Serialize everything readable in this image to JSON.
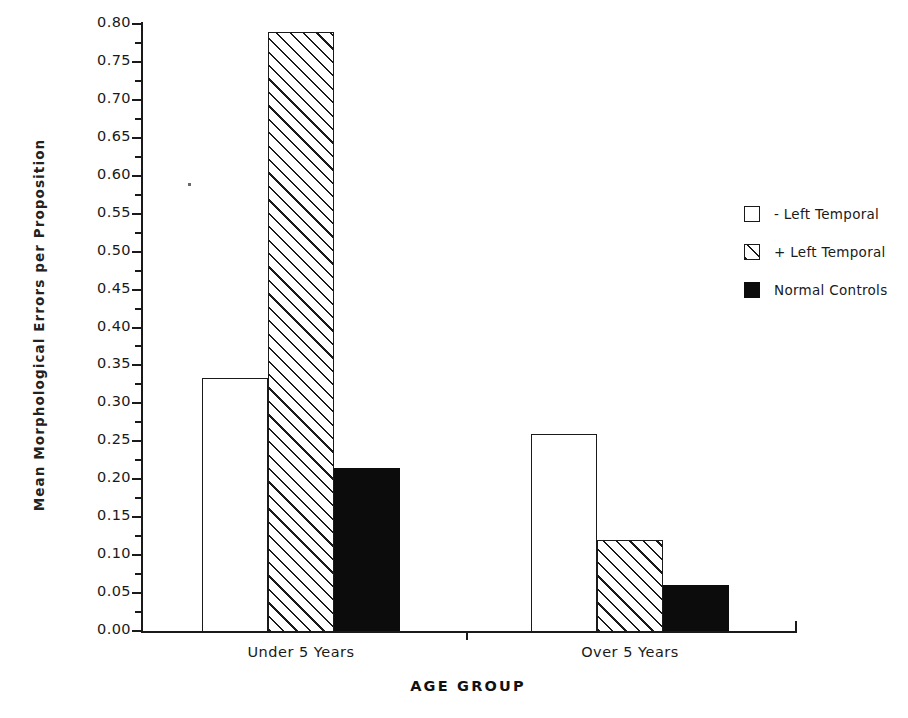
{
  "chart_data": {
    "type": "bar",
    "title": "",
    "xlabel": "AGE GROUP",
    "ylabel": "Mean  Morphological  Errors  per  Proposition",
    "categories": [
      "Under 5 Years",
      "Over 5 Years"
    ],
    "series": [
      {
        "name": "- Left Temporal",
        "fill": "open",
        "values": [
          0.333,
          0.26
        ]
      },
      {
        "name": "+ Left Temporal",
        "fill": "hatch",
        "values": [
          0.79,
          0.12
        ]
      },
      {
        "name": "Normal Controls",
        "fill": "solid",
        "values": [
          0.215,
          0.06
        ]
      }
    ],
    "ylim": [
      0.0,
      0.8
    ],
    "ytick_step": 0.05,
    "yminor_step": 0.025,
    "ytick_labels": [
      "0.00",
      "0.05",
      "0.10",
      "0.15",
      "0.20",
      "0.25",
      "0.30",
      "0.35",
      "0.40",
      "0.45",
      "0.50",
      "0.55",
      "0.60",
      "0.65",
      "0.70",
      "0.75",
      "0.80"
    ],
    "ytick_values": [
      0.0,
      0.05,
      0.1,
      0.15,
      0.2,
      0.25,
      0.3,
      0.35,
      0.4,
      0.45,
      0.5,
      0.55,
      0.6,
      0.65,
      0.7,
      0.75,
      0.8
    ],
    "grid": false,
    "legend_position": "right",
    "colors": {
      "axis": "#1a1a1a",
      "open_fill": "#ffffff",
      "hatch_line": "#1a1a1a",
      "solid_fill": "#0c0c0c",
      "background": "#ffffff"
    }
  },
  "legend": {
    "items": [
      {
        "label": "- Left Temporal",
        "fill": "open"
      },
      {
        "label": "+ Left Temporal",
        "fill": "hatch"
      },
      {
        "label": "Normal Controls",
        "fill": "solid"
      }
    ]
  }
}
